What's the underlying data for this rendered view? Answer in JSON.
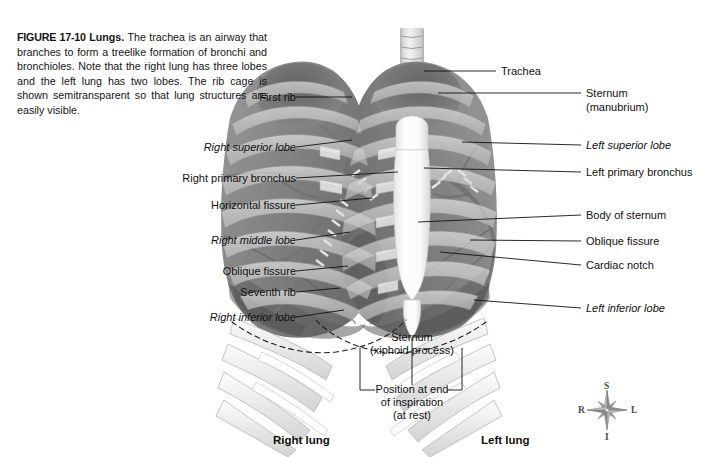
{
  "figure": {
    "number": "FIGURE 17-10",
    "title": "Lungs.",
    "caption": "The trachea is an airway that branches to form a treelike formation of bronchi and bronchioles. Note that the right lung has three lobes and the left lung has two lobes. The rib cage is shown semitransparent so that lung structures are easily visible."
  },
  "labels_left": [
    {
      "text": "First rib",
      "italic": false
    },
    {
      "text": "Right superior lobe",
      "italic": true
    },
    {
      "text": "Right primary bronchus",
      "italic": false
    },
    {
      "text": "Horizontal fissure",
      "italic": false
    },
    {
      "text": "Right middle lobe",
      "italic": true
    },
    {
      "text": "Oblique fissure",
      "italic": false
    },
    {
      "text": "Seventh rib",
      "italic": false
    },
    {
      "text": "Right inferior lobe",
      "italic": true
    }
  ],
  "labels_right": [
    {
      "text": "Trachea",
      "italic": false
    },
    {
      "text": "Sternum",
      "text2": "(manubrium)",
      "italic": false
    },
    {
      "text": "Left superior lobe",
      "italic": true
    },
    {
      "text": "Left primary bronchus",
      "italic": false
    },
    {
      "text": "Body of sternum",
      "italic": false
    },
    {
      "text": "Oblique fissure",
      "italic": false
    },
    {
      "text": "Cardiac notch",
      "italic": false
    },
    {
      "text": "Left inferior lobe",
      "italic": true
    }
  ],
  "labels_center": [
    {
      "line1": "Sternum",
      "line2": "(xiphoid process)"
    },
    {
      "line1": "Position at end",
      "line2": "of inspiration",
      "line3": "(at rest)"
    }
  ],
  "labels_bottom": [
    {
      "text": "Right lung"
    },
    {
      "text": "Left lung"
    }
  ],
  "compass": {
    "superior": "S",
    "inferior": "I",
    "right": "R",
    "left": "L"
  },
  "colors": {
    "background": "#ffffff",
    "text": "#101010",
    "leader": "#111111",
    "lung_dark": "#6e6e6e",
    "lung_mid": "#8e8e8e",
    "lung_light": "#b4b4b4",
    "rib_light": "#d8d8d8",
    "rib_pale": "#ededed",
    "sternum": "#fbfbfb",
    "compass": "#4a4a4a"
  }
}
